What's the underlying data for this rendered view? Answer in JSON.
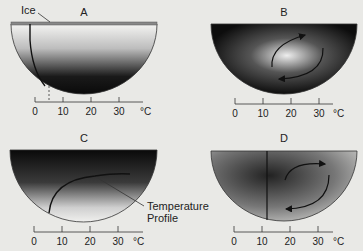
{
  "panels": [
    {
      "id": "A",
      "label": "A",
      "description": "Ice-covered lake, stratified, temperature profile near 4°C",
      "annotation": "Ice"
    },
    {
      "id": "B",
      "label": "B",
      "description": "Warm center with circulation arrows"
    },
    {
      "id": "C",
      "label": "C",
      "description": "Dark surface, temperature profile curve",
      "annotation": "Temperature Profile"
    },
    {
      "id": "D",
      "label": "D",
      "description": "Well mixed, vertical profile near 12°C, circulation arrows"
    }
  ],
  "axis": {
    "ticks": [
      "0",
      "10",
      "20",
      "30"
    ],
    "unit": "°C"
  },
  "annotations": {
    "ice": "Ice",
    "temperature_profile_line1": "Temperature",
    "temperature_profile_line2": "Profile"
  },
  "colors": {
    "background": "#e9e9e6",
    "dark": "#111111",
    "light": "#f2f2f0"
  }
}
